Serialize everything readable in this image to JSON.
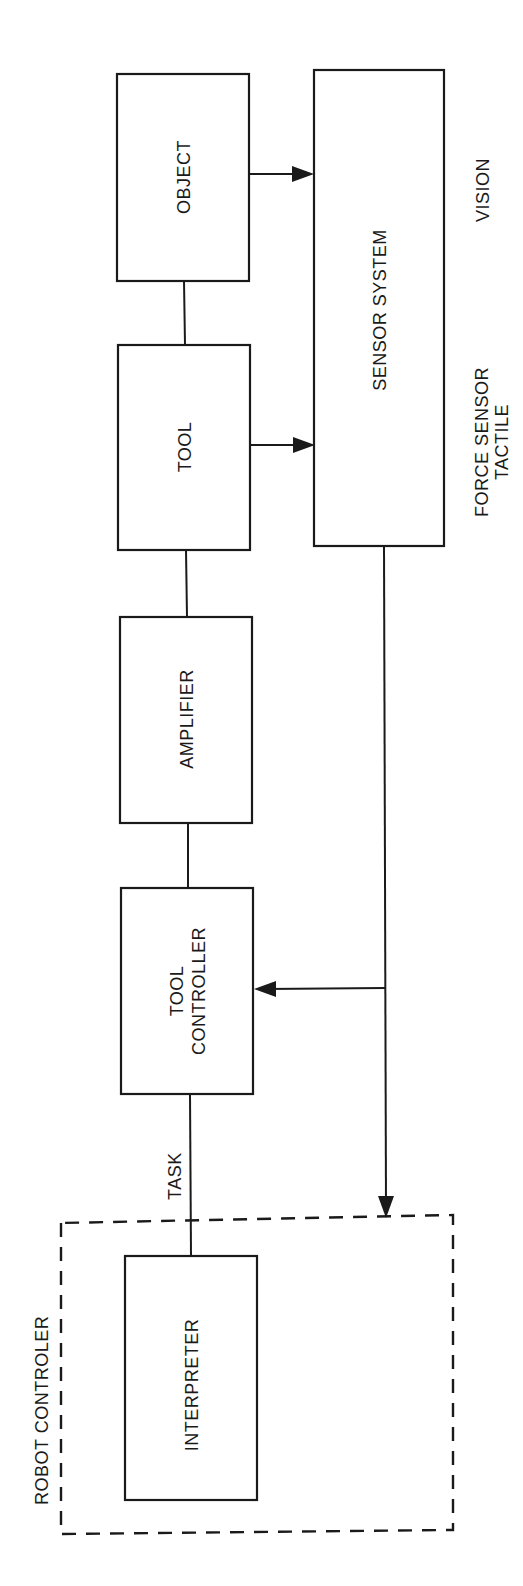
{
  "diagram": {
    "colors": {
      "stroke": "#1a1a1a",
      "background": "#ffffff"
    },
    "blocks": {
      "object": {
        "label": "OBJECT"
      },
      "tool": {
        "label": "TOOL"
      },
      "amplifier": {
        "label": "AMPLIFIER"
      },
      "tool_controller": {
        "label_line1": "TOOL",
        "label_line2": "CONTROLLER"
      },
      "interpreter": {
        "label": "INTERPRETER"
      },
      "sensor_system": {
        "label": "SENSOR SYSTEM"
      }
    },
    "group": {
      "robot_controller": {
        "label": "ROBOT CONTROLER",
        "style": "dashed"
      }
    },
    "annotations": {
      "vision": "VISION",
      "force_sensor_line1": "FORCE SENSOR",
      "force_sensor_line2": "TACTILE",
      "task": "TASK"
    },
    "connections": [
      {
        "from": "object",
        "to": "tool",
        "type": "line"
      },
      {
        "from": "tool",
        "to": "amplifier",
        "type": "line"
      },
      {
        "from": "amplifier",
        "to": "tool_controller",
        "type": "line"
      },
      {
        "from": "tool_controller",
        "to": "interpreter",
        "type": "line",
        "label": "TASK"
      },
      {
        "from": "object",
        "to": "sensor_system",
        "type": "arrow"
      },
      {
        "from": "tool",
        "to": "sensor_system",
        "type": "arrow"
      },
      {
        "from": "sensor_system",
        "to": "tool_controller",
        "type": "arrow"
      },
      {
        "from": "sensor_system",
        "to": "robot_controller",
        "type": "arrow"
      }
    ]
  }
}
